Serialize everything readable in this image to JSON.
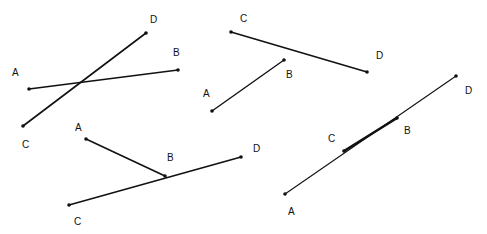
{
  "colors": {
    "line": "#111111",
    "background": "#ffffff"
  },
  "figures": [
    {
      "name": "intersecting-segments",
      "segments": [
        {
          "from": "A",
          "to": "B",
          "x1": 29,
          "y1": 89,
          "x2": 178,
          "y2": 70,
          "width": 1.6
        },
        {
          "from": "C",
          "to": "D",
          "x1": 23,
          "y1": 126,
          "x2": 146,
          "y2": 33,
          "width": 1.6
        }
      ],
      "points": [
        {
          "label": "A",
          "x": 29,
          "y": 89,
          "lx": 12,
          "ly": 76
        },
        {
          "label": "B",
          "x": 178,
          "y": 70,
          "lx": 173,
          "ly": 56
        },
        {
          "label": "C",
          "x": 23,
          "y": 126,
          "lx": 22,
          "ly": 148
        },
        {
          "label": "D",
          "x": 146,
          "y": 33,
          "lx": 150,
          "ly": 23
        }
      ]
    },
    {
      "name": "non-intersecting-segments",
      "segments": [
        {
          "from": "C",
          "to": "D",
          "x1": 231,
          "y1": 32,
          "x2": 367,
          "y2": 72,
          "width": 1.6
        },
        {
          "from": "A",
          "to": "B",
          "x1": 212,
          "y1": 111,
          "x2": 284,
          "y2": 60,
          "width": 1.4
        }
      ],
      "points": [
        {
          "label": "C",
          "x": 231,
          "y": 32,
          "lx": 240,
          "ly": 22
        },
        {
          "label": "D",
          "x": 367,
          "y": 72,
          "lx": 376,
          "ly": 59
        },
        {
          "label": "A",
          "x": 212,
          "y": 111,
          "lx": 203,
          "ly": 97
        },
        {
          "label": "B",
          "x": 284,
          "y": 60,
          "lx": 286,
          "ly": 78
        }
      ]
    },
    {
      "name": "touching-segments",
      "segments": [
        {
          "from": "A",
          "to": "B",
          "x1": 86,
          "y1": 139,
          "x2": 165,
          "y2": 176,
          "width": 1.6
        },
        {
          "from": "C",
          "to": "D",
          "x1": 69,
          "y1": 205,
          "x2": 241,
          "y2": 157,
          "width": 1.6
        }
      ],
      "points": [
        {
          "label": "A",
          "x": 86,
          "y": 139,
          "lx": 75,
          "ly": 131
        },
        {
          "label": "B",
          "x": 165,
          "y": 176,
          "lx": 167,
          "ly": 161
        },
        {
          "label": "C",
          "x": 69,
          "y": 205,
          "lx": 74,
          "ly": 225
        },
        {
          "label": "D",
          "x": 241,
          "y": 157,
          "lx": 253,
          "ly": 152
        }
      ]
    },
    {
      "name": "overlapping-segments",
      "segments": [
        {
          "from": "A",
          "to": "D",
          "x1": 285,
          "y1": 194,
          "x2": 456,
          "y2": 76,
          "width": 1.1
        },
        {
          "from": "C",
          "to": "B",
          "x1": 344,
          "y1": 151,
          "x2": 397,
          "y2": 118,
          "width": 2.6
        }
      ],
      "points": [
        {
          "label": "A",
          "x": 285,
          "y": 194,
          "lx": 288,
          "ly": 215
        },
        {
          "label": "D",
          "x": 456,
          "y": 76,
          "lx": 465,
          "ly": 94
        },
        {
          "label": "C",
          "x": 344,
          "y": 151,
          "lx": 328,
          "ly": 142
        },
        {
          "label": "B",
          "x": 397,
          "y": 118,
          "lx": 404,
          "ly": 134
        }
      ]
    }
  ]
}
